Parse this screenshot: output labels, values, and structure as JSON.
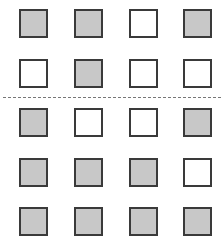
{
  "grid": {
    "columns": 4,
    "col_x": [
      19,
      74,
      129,
      183
    ],
    "row_y": [
      9,
      59,
      108,
      158,
      207
    ],
    "fill_color": "#c8c8c8",
    "empty_color": "#ffffff",
    "border_color": "#3a3a3a",
    "rows": [
      [
        "filled",
        "filled",
        "empty",
        "filled"
      ],
      [
        "empty",
        "filled",
        "empty",
        "empty"
      ],
      [
        "filled",
        "empty",
        "empty",
        "filled"
      ],
      [
        "filled",
        "filled",
        "filled",
        "empty"
      ],
      [
        "filled",
        "filled",
        "filled",
        "filled"
      ]
    ]
  },
  "divider": {
    "style": "dashed",
    "after_row": 2,
    "y": 97,
    "color": "#777777"
  }
}
